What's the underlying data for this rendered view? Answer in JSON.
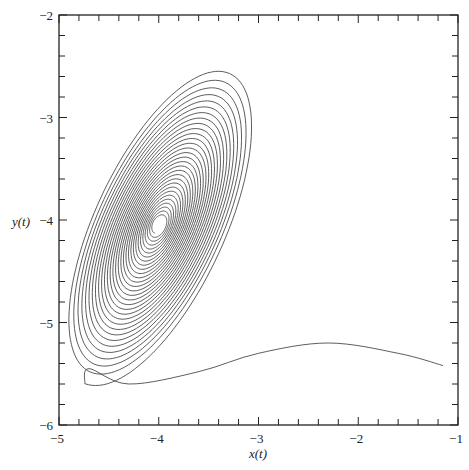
{
  "chart_data": {
    "type": "line",
    "title": "",
    "xlabel": "x(t)",
    "ylabel": "y(t)",
    "xlim": [
      -5,
      -1
    ],
    "ylim": [
      -6,
      -2
    ],
    "x_major_ticks": [
      -5,
      -4,
      -3,
      -2,
      -1
    ],
    "x_tick_labels": [
      "−5",
      "−4",
      "−3",
      "−2",
      "−1"
    ],
    "y_major_ticks": [
      -6,
      -5,
      -4,
      -3,
      -2
    ],
    "y_tick_labels": [
      "−6",
      "−5",
      "−4",
      "−3",
      "−2"
    ],
    "minor_tick_step": 0.2,
    "grid": false,
    "legend": null,
    "line_color": "#333333",
    "series": [
      {
        "name": "trajectory",
        "description": "Phase-plane trajectory spiraling inward to a stable focus",
        "start_point": [
          -1.15,
          -5.42
        ],
        "tail_points": [
          [
            -1.15,
            -5.42
          ],
          [
            -1.6,
            -5.3
          ],
          [
            -2.3,
            -5.2
          ],
          [
            -3.0,
            -5.3
          ],
          [
            -3.6,
            -5.48
          ],
          [
            -4.3,
            -5.6
          ],
          [
            -4.7,
            -5.45
          ]
        ],
        "spiral_center": [
          -4.0,
          -4.05
        ],
        "spiral_outer_extent": {
          "x_min": -4.82,
          "x_max": -3.2,
          "y_min": -5.45,
          "y_max": -2.62
        },
        "spiral_turns": 30,
        "inner_hole_radius": 0.08
      }
    ]
  },
  "layout": {
    "plot_left_px": 59,
    "plot_right_px": 458,
    "plot_top_px": 15,
    "plot_bottom_px": 425
  }
}
